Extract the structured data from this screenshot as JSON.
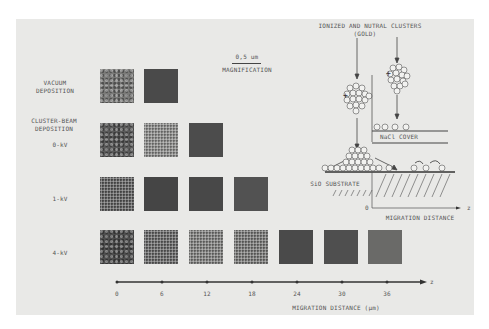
{
  "diagram": {
    "scale_bar": {
      "value": "0,5 um",
      "label": "MAGNIFICATION"
    },
    "rows": [
      {
        "label": "VACUUM\nDEPOSITION",
        "line1": "VACUUM",
        "line2": "DEPOSITION"
      },
      {
        "label": "CLUSTER-BEAM\nDEPOSITION",
        "line1": "CLUSTER-BEAM",
        "line2": "DEPOSITION"
      },
      {
        "label": "0-kV"
      },
      {
        "label": "1-kV"
      },
      {
        "label": "4-kV"
      }
    ],
    "squares": {
      "vacuum": [
        "#7a7a78",
        "#4a4a4a"
      ],
      "kv0": [
        "#5a5a5a",
        "#8a8a88",
        "#4c4c4c"
      ],
      "kv1": [
        "#555555",
        "#454545",
        "#484848",
        "#525252"
      ],
      "kv4": [
        "#4e4e4e",
        "#5e5e5e",
        "#7a7a78",
        "#727270",
        "#4a4a4a",
        "#4f4f4f",
        "#6a6a68"
      ]
    },
    "axis": {
      "ticks": [
        "0",
        "6",
        "12",
        "18",
        "24",
        "30",
        "36"
      ],
      "end_label": "z",
      "title": "MIGRATION DISTANCE (µm)"
    },
    "schematic": {
      "title_line1": "IONIZED AND NUTRAL CLUSTERS",
      "title_line2": "(GOLD)",
      "cover_label": "NaCl COVER",
      "substrate_label": "SiO SUBSTRATE",
      "origin_label": "0",
      "axis_end_label": "z",
      "axis_title": "MIGRATION DISTANCE",
      "charge_symbol": "+"
    }
  }
}
